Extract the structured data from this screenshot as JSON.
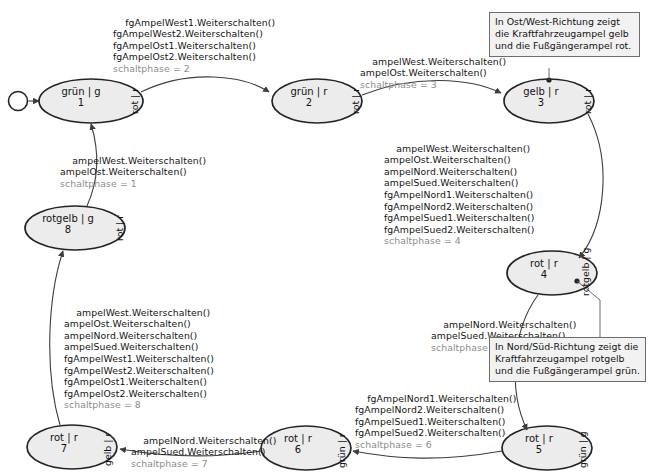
{
  "diagram": {
    "type": "uml-state-machine",
    "colors": {
      "state_fill": "#ececec",
      "state_border": "#242424",
      "edge": "#3d3d3d",
      "note_fill": "#f2f2f2",
      "note_border": "#6d6d6d",
      "guard_text": "#8d8d8d",
      "text": "#141414"
    },
    "initial_node": {
      "name": "initial-pseudostate"
    },
    "states": [
      {
        "id": "1",
        "label": "grün | g",
        "number": "1",
        "side": "rot | r"
      },
      {
        "id": "2",
        "label": "grün | r",
        "number": "2",
        "side": "rot | r"
      },
      {
        "id": "3",
        "label": "gelb | r",
        "number": "3",
        "side": "rot | r"
      },
      {
        "id": "4",
        "label": "rot | r",
        "number": "4",
        "side": "rotgelb | g"
      },
      {
        "id": "5",
        "label": "rot | r",
        "number": "5",
        "side": "grün | g"
      },
      {
        "id": "6",
        "label": "rot | r",
        "number": "6",
        "side": "grün | r"
      },
      {
        "id": "7",
        "label": "rot | r",
        "number": "7",
        "side": "gelb | r"
      },
      {
        "id": "8",
        "label": "rotgelb | g",
        "number": "8",
        "side": "rot | r"
      }
    ],
    "transitions": [
      {
        "id": "t1-2",
        "from": "1",
        "to": "2",
        "actions": [
          "fgAmpelWest1.Weiterschalten()",
          "fgAmpelWest2.Weiterschalten()",
          "fgAmpelOst1.Weiterschalten()",
          "fgAmpelOst2.Weiterschalten()"
        ],
        "guard": "schaltphase = 2"
      },
      {
        "id": "t2-3",
        "from": "2",
        "to": "3",
        "actions": [
          "ampelWest.Weiterschalten()",
          "ampelOst.Weiterschalten()"
        ],
        "guard": "schaltphase = 3"
      },
      {
        "id": "t3-4",
        "from": "3",
        "to": "4",
        "actions": [
          "ampelWest.Weiterschalten()",
          "ampelOst.Weiterschalten()",
          "ampelNord.Weiterschalten()",
          "ampelSued.Weiterschalten()",
          "fgAmpelNord1.Weiterschalten()",
          "fgAmpelNord2.Weiterschalten()",
          "fgAmpelSued1.Weiterschalten()",
          "fgAmpelSued2.Weiterschalten()"
        ],
        "guard": "schaltphase = 4"
      },
      {
        "id": "t4-5",
        "from": "4",
        "to": "5",
        "actions": [
          "ampelNord.Weiterschalten()",
          "ampelSued.Weiterschalten()"
        ],
        "guard": "schaltphase = 5"
      },
      {
        "id": "t5-6",
        "from": "5",
        "to": "6",
        "actions": [
          "fgAmpelNord1.Weiterschalten()",
          "fgAmpelNord2.Weiterschalten()",
          "fgAmpelSued1.Weiterschalten()",
          "fgAmpelSued2.Weiterschalten()"
        ],
        "guard": "schaltphase = 6"
      },
      {
        "id": "t6-7",
        "from": "6",
        "to": "7",
        "actions": [
          "ampelNord.Weiterschalten()",
          "ampelSued.Weiterschalten()"
        ],
        "guard": "schaltphase = 7"
      },
      {
        "id": "t7-8",
        "from": "7",
        "to": "8",
        "actions": [
          "ampelWest.Weiterschalten()",
          "ampelOst.Weiterschalten()",
          "ampelNord.Weiterschalten()",
          "ampelSued.Weiterschalten()",
          "fgAmpelWest1.Weiterschalten()",
          "fgAmpelWest2.Weiterschalten()",
          "fgAmpelOst1.Weiterschalten()",
          "fgAmpelOst2.Weiterschalten()"
        ],
        "guard": "schaltphase = 8"
      },
      {
        "id": "t8-1",
        "from": "8",
        "to": "1",
        "actions": [
          "ampelWest.Weiterschalten()",
          "ampelOst.Weiterschalten()"
        ],
        "guard": "schaltphase = 1"
      }
    ],
    "notes": [
      {
        "id": "note-state-3",
        "attached_to": "3",
        "text": "In Ost/West-Richtung zeigt die Kraftfahrzeugampel gelb und die Fußgängerampel rot."
      },
      {
        "id": "note-state-4",
        "attached_to": "4",
        "text": "In Nord/Süd-Richtung zeigt die Kraftfahrzeugampel rotgelb und die Fußgängerampel grün."
      }
    ]
  }
}
